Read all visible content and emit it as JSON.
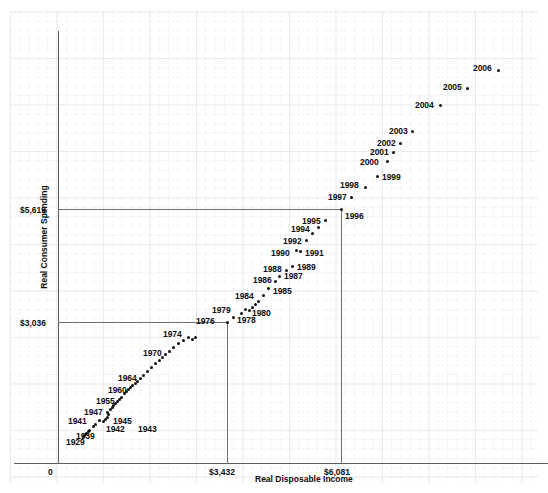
{
  "chart_data": {
    "type": "scatter",
    "title": "",
    "xlabel": "Real Disposable Income",
    "ylabel": "Real Consumer Spending",
    "xticks": [
      "0",
      "$3,432",
      "$6,081"
    ],
    "xtick_values": [
      0,
      3432,
      6081
    ],
    "yticks": [
      "$3,036",
      "$5,619"
    ],
    "ytick_values": [
      3036,
      5619
    ],
    "xlim": [
      0,
      9000
    ],
    "ylim": [
      0,
      8200
    ],
    "grid": true,
    "legend": null,
    "reference_lines": [
      {
        "axis": "y",
        "value": 5619,
        "label": "$5,619",
        "to_x": 6081
      },
      {
        "axis": "y",
        "value": 3036,
        "label": "$3,036",
        "to_x": 3432
      },
      {
        "axis": "x",
        "value": 6081,
        "label": "$6,081",
        "to_y": 5619
      },
      {
        "axis": "x",
        "value": 3432,
        "label": "$3,432",
        "to_y": 3036
      }
    ],
    "point_labels": [
      "1929",
      "1939",
      "1941",
      "1942",
      "1943",
      "1945",
      "1947",
      "1955",
      "1960",
      "1964",
      "1970",
      "1974",
      "1976",
      "1978",
      "1979",
      "1980",
      "1984",
      "1985",
      "1986",
      "1987",
      "1988",
      "1989",
      "1990",
      "1991",
      "1992",
      "1994",
      "1995",
      "1996",
      "1997",
      "1998",
      "1999",
      "2000",
      "2001",
      "2002",
      "2003",
      "2004",
      "2005",
      "2006"
    ],
    "points": [
      {
        "label": "1929",
        "x": 1185,
        "y": 1110,
        "px": 89,
        "py": 430,
        "lx": 66,
        "ly": 437,
        "show": true
      },
      {
        "label": "",
        "x": 1060,
        "y": 1010,
        "px": 85,
        "py": 434,
        "show": false
      },
      {
        "label": "",
        "x": 1000,
        "y": 960,
        "px": 83,
        "py": 436,
        "show": false
      },
      {
        "label": "",
        "x": 1020,
        "y": 980,
        "px": 84,
        "py": 435,
        "show": false
      },
      {
        "label": "",
        "x": 1090,
        "y": 1040,
        "px": 86,
        "py": 433,
        "show": false
      },
      {
        "label": "",
        "x": 1160,
        "y": 1090,
        "px": 88,
        "py": 431,
        "show": false
      },
      {
        "label": "1939",
        "x": 1300,
        "y": 1220,
        "px": 93,
        "py": 426,
        "lx": 76,
        "ly": 431,
        "show": true
      },
      {
        "label": "",
        "x": 1380,
        "y": 1280,
        "px": 95,
        "py": 424,
        "show": false
      },
      {
        "label": "1941",
        "x": 1510,
        "y": 1350,
        "px": 99,
        "py": 420,
        "lx": 68,
        "ly": 416,
        "show": true
      },
      {
        "label": "1942",
        "x": 1620,
        "y": 1330,
        "px": 103,
        "py": 421,
        "lx": 106,
        "ly": 424,
        "show": true
      },
      {
        "label": "1943",
        "x": 1680,
        "y": 1370,
        "px": 105,
        "py": 419,
        "lx": 138,
        "ly": 424,
        "show": true
      },
      {
        "label": "",
        "x": 1720,
        "y": 1410,
        "px": 107,
        "py": 417,
        "show": false
      },
      {
        "label": "1945",
        "x": 1760,
        "y": 1470,
        "px": 108,
        "py": 414,
        "lx": 113,
        "ly": 416,
        "show": true
      },
      {
        "label": "",
        "x": 1740,
        "y": 1520,
        "px": 107,
        "py": 412,
        "show": false
      },
      {
        "label": "1947",
        "x": 1800,
        "y": 1560,
        "px": 110,
        "py": 409,
        "lx": 84,
        "ly": 407,
        "show": true
      },
      {
        "label": "",
        "x": 1860,
        "y": 1600,
        "px": 112,
        "py": 407,
        "show": false
      },
      {
        "label": "",
        "x": 1900,
        "y": 1650,
        "px": 113,
        "py": 405,
        "show": false
      },
      {
        "label": "",
        "x": 1960,
        "y": 1700,
        "px": 115,
        "py": 403,
        "show": false
      },
      {
        "label": "",
        "x": 2010,
        "y": 1740,
        "px": 117,
        "py": 401,
        "show": false
      },
      {
        "label": "",
        "x": 2070,
        "y": 1790,
        "px": 119,
        "py": 399,
        "show": false
      },
      {
        "label": "",
        "x": 2120,
        "y": 1840,
        "px": 121,
        "py": 397,
        "show": false
      },
      {
        "label": "1955",
        "x": 2200,
        "y": 1920,
        "px": 124,
        "py": 393,
        "lx": 96,
        "ly": 396,
        "show": true
      },
      {
        "label": "",
        "x": 2260,
        "y": 1960,
        "px": 126,
        "py": 391,
        "show": false
      },
      {
        "label": "",
        "x": 2310,
        "y": 2000,
        "px": 128,
        "py": 389,
        "show": false
      },
      {
        "label": "",
        "x": 2360,
        "y": 2040,
        "px": 130,
        "py": 387,
        "show": false
      },
      {
        "label": "",
        "x": 2420,
        "y": 2080,
        "px": 132,
        "py": 385,
        "show": false
      },
      {
        "label": "1960",
        "x": 2490,
        "y": 2130,
        "px": 135,
        "py": 383,
        "lx": 108,
        "ly": 385,
        "show": true
      },
      {
        "label": "",
        "x": 2540,
        "y": 2170,
        "px": 137,
        "py": 381,
        "show": false
      },
      {
        "label": "",
        "x": 2620,
        "y": 2240,
        "px": 140,
        "py": 378,
        "show": false
      },
      {
        "label": "",
        "x": 2700,
        "y": 2310,
        "px": 143,
        "py": 375,
        "show": false
      },
      {
        "label": "1964",
        "x": 2800,
        "y": 2390,
        "px": 147,
        "py": 371,
        "lx": 118,
        "ly": 373,
        "show": true
      },
      {
        "label": "",
        "x": 2900,
        "y": 2480,
        "px": 151,
        "py": 367,
        "show": false
      },
      {
        "label": "",
        "x": 3010,
        "y": 2560,
        "px": 155,
        "py": 363,
        "show": false
      },
      {
        "label": "",
        "x": 3110,
        "y": 2620,
        "px": 159,
        "py": 360,
        "show": false
      },
      {
        "label": "",
        "x": 3180,
        "y": 2680,
        "px": 162,
        "py": 357,
        "show": false
      },
      {
        "label": "",
        "x": 3260,
        "y": 2740,
        "px": 165,
        "py": 354,
        "show": false
      },
      {
        "label": "1970",
        "x": 3360,
        "y": 2800,
        "px": 169,
        "py": 351,
        "lx": 143,
        "ly": 348,
        "show": true
      },
      {
        "label": "",
        "x": 3470,
        "y": 2880,
        "px": 173,
        "py": 347,
        "show": false
      },
      {
        "label": "",
        "x": 3600,
        "y": 2960,
        "px": 178,
        "py": 343,
        "show": false
      },
      {
        "label": "",
        "x": 3720,
        "y": 3010,
        "px": 183,
        "py": 340,
        "show": false
      },
      {
        "label": "",
        "x": 3840,
        "y": 3070,
        "px": 188,
        "py": 337,
        "show": false
      },
      {
        "label": "1974",
        "x": 3950,
        "y": 3020,
        "px": 192,
        "py": 339,
        "lx": 163,
        "ly": 329,
        "show": true
      },
      {
        "label": "",
        "x": 4020,
        "y": 3060,
        "px": 195,
        "py": 337,
        "show": false
      },
      {
        "label": "1976",
        "x": 4230,
        "y": 3200,
        "px": 227,
        "py": 322,
        "lx": 196,
        "ly": 316,
        "show": true
      },
      {
        "label": "",
        "x": 4380,
        "y": 3280,
        "px": 233,
        "py": 317,
        "show": false
      },
      {
        "label": "1978",
        "x": 4540,
        "y": 3380,
        "px": 241,
        "py": 313,
        "lx": 237,
        "ly": 315,
        "show": true
      },
      {
        "label": "1979",
        "x": 4620,
        "y": 3450,
        "px": 245,
        "py": 309,
        "lx": 212,
        "ly": 305,
        "show": true
      },
      {
        "label": "1980",
        "x": 4700,
        "y": 3430,
        "px": 249,
        "py": 310,
        "lx": 252,
        "ly": 308,
        "show": true
      },
      {
        "label": "",
        "x": 4760,
        "y": 3480,
        "px": 252,
        "py": 307,
        "show": false
      },
      {
        "label": "",
        "x": 4820,
        "y": 3520,
        "px": 255,
        "py": 304,
        "show": false
      },
      {
        "label": "",
        "x": 4890,
        "y": 3580,
        "px": 258,
        "py": 301,
        "show": false
      },
      {
        "label": "1984",
        "x": 5010,
        "y": 3700,
        "px": 263,
        "py": 295,
        "lx": 235,
        "ly": 291,
        "show": true
      },
      {
        "label": "1985",
        "x": 5100,
        "y": 3830,
        "px": 268,
        "py": 288,
        "lx": 273,
        "ly": 286,
        "show": true
      },
      {
        "label": "1986",
        "x": 5240,
        "y": 3960,
        "px": 275,
        "py": 281,
        "lx": 253,
        "ly": 275,
        "show": true
      },
      {
        "label": "1987",
        "x": 5330,
        "y": 4060,
        "px": 279,
        "py": 276,
        "lx": 284,
        "ly": 271,
        "show": true
      },
      {
        "label": "1988",
        "x": 5470,
        "y": 4180,
        "px": 286,
        "py": 270,
        "lx": 263,
        "ly": 264,
        "show": true
      },
      {
        "label": "1989",
        "x": 5600,
        "y": 4260,
        "px": 292,
        "py": 266,
        "lx": 297,
        "ly": 262,
        "show": true
      },
      {
        "label": "1990",
        "x": 5670,
        "y": 4340,
        "px": 296,
        "py": 250,
        "lx": 271,
        "ly": 248,
        "show": true
      },
      {
        "label": "1991",
        "x": 5720,
        "y": 4360,
        "px": 300,
        "py": 251,
        "lx": 305,
        "ly": 248,
        "show": true
      },
      {
        "label": "1992",
        "x": 5850,
        "y": 4470,
        "px": 306,
        "py": 240,
        "lx": 283,
        "ly": 236,
        "show": true
      },
      {
        "label": "",
        "x": 5980,
        "y": 4600,
        "px": 312,
        "py": 233,
        "show": false
      },
      {
        "label": "1994",
        "x": 6100,
        "y": 4740,
        "px": 318,
        "py": 227,
        "lx": 291,
        "ly": 224,
        "show": true
      },
      {
        "label": "1995",
        "x": 6230,
        "y": 4850,
        "px": 325,
        "py": 220,
        "lx": 302,
        "ly": 216,
        "show": true
      },
      {
        "label": "1996",
        "x": 6400,
        "y": 5000,
        "px": 341,
        "py": 209,
        "lx": 345,
        "ly": 211,
        "show": true
      },
      {
        "label": "1997",
        "x": 6620,
        "y": 5200,
        "px": 351,
        "py": 197,
        "lx": 328,
        "ly": 192,
        "show": true
      },
      {
        "label": "1998",
        "x": 6940,
        "y": 5420,
        "px": 365,
        "py": 187,
        "lx": 340,
        "ly": 180,
        "show": true
      },
      {
        "label": "1999",
        "x": 7130,
        "y": 5650,
        "px": 377,
        "py": 176,
        "lx": 382,
        "ly": 172,
        "show": true
      },
      {
        "label": "2000",
        "x": 7370,
        "y": 5860,
        "px": 387,
        "py": 161,
        "lx": 360,
        "ly": 157,
        "show": true
      },
      {
        "label": "2001",
        "x": 7480,
        "y": 5960,
        "px": 393,
        "py": 152,
        "lx": 370,
        "ly": 147,
        "show": true
      },
      {
        "label": "2002",
        "x": 7610,
        "y": 6100,
        "px": 400,
        "py": 143,
        "lx": 377,
        "ly": 138,
        "show": true
      },
      {
        "label": "2003",
        "x": 7760,
        "y": 6250,
        "px": 412,
        "py": 131,
        "lx": 389,
        "ly": 126,
        "show": true
      },
      {
        "label": "2004",
        "x": 7980,
        "y": 6460,
        "px": 440,
        "py": 105,
        "lx": 415,
        "ly": 100,
        "show": true
      },
      {
        "label": "2005",
        "x": 8180,
        "y": 6680,
        "px": 467,
        "py": 88,
        "lx": 443,
        "ly": 82,
        "show": true
      },
      {
        "label": "2006",
        "x": 8400,
        "y": 6900,
        "px": 498,
        "py": 70,
        "lx": 473,
        "ly": 63,
        "show": true
      }
    ]
  },
  "axes": {
    "y_axis_top": 31,
    "y_axis_bottom": 463,
    "y_axis_x": 58,
    "x_axis_y": 463,
    "x_axis_left": 14,
    "x_axis_right": 548
  },
  "tick_labels": {
    "x0": "0",
    "x1": "$3,432",
    "x2": "$6,081",
    "y1": "$3,036",
    "y2": "$5,619"
  },
  "axis_titles": {
    "x": "Real Disposable Income",
    "y": "Real Consumer Spending"
  },
  "colors": {
    "point": "#101010",
    "axis": "#5d5d5d",
    "reference": "#6f6f6f",
    "grid_minor": "#f4f5f7",
    "grid_major": "#e9eaee",
    "text": "#0e0e0e",
    "background": "#ffffff"
  }
}
